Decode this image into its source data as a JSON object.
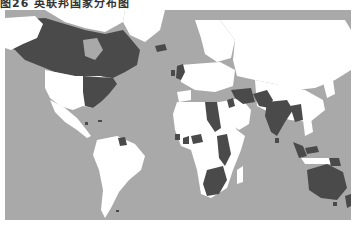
{
  "caption": "图26 英联邦国家分布图",
  "map": {
    "title": "Commonwealth member states world map",
    "projection": "Mercator",
    "colors": {
      "ocean": "#a9a9a9",
      "land_other": "#ffffff",
      "commonwealth": "#4a4a4a",
      "border": "#c8c8c8"
    },
    "highlighted_regions": [
      "Canada",
      "United Kingdom",
      "Guyana",
      "Belize",
      "Jamaica",
      "Bahamas",
      "Nigeria",
      "Ghana",
      "Sierra Leone",
      "Gambia",
      "Cameroon",
      "Uganda",
      "Kenya",
      "Tanzania",
      "Zambia",
      "Malawi",
      "Mozambique",
      "Zimbabwe",
      "Botswana",
      "Namibia",
      "South Africa",
      "Sudan (historical)",
      "Egypt (historical)",
      "Iraq (historical)",
      "Jordan (historical)",
      "Pakistan",
      "India",
      "Bangladesh",
      "Sri Lanka",
      "Myanmar (historical)",
      "Malaysia",
      "Papua New Guinea",
      "Australia",
      "New Zealand",
      "United States (eastern, historical)"
    ]
  }
}
